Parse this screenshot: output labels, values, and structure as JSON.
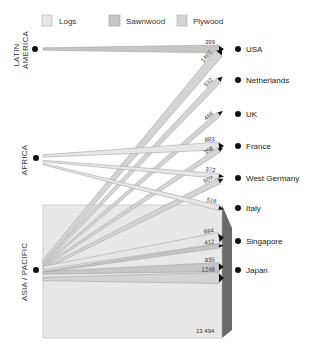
{
  "legend": [
    {
      "key": "logs",
      "label": "Logs",
      "color": "#e6e6e6"
    },
    {
      "key": "sawnwood",
      "label": "Sawnwood",
      "color": "#c6c6c6"
    },
    {
      "key": "plywood",
      "label": "Plywood",
      "color": "#d4d4d4"
    }
  ],
  "sources": [
    {
      "id": "latin_america",
      "lines": [
        "LATIN",
        "AMERICA"
      ]
    },
    {
      "id": "africa",
      "lines": [
        "AFRICA"
      ]
    },
    {
      "id": "asia_pacific",
      "lines": [
        "ASIA / PACIFIC"
      ]
    }
  ],
  "destinations": [
    {
      "id": "usa",
      "label": "USA"
    },
    {
      "id": "netherlands",
      "label": "Netherlands"
    },
    {
      "id": "uk",
      "label": "UK"
    },
    {
      "id": "france",
      "label": "France"
    },
    {
      "id": "west_germany",
      "label": "West Germany"
    },
    {
      "id": "italy",
      "label": "Italy"
    },
    {
      "id": "singapore",
      "label": "Singapore"
    },
    {
      "id": "japan",
      "label": "Japan"
    }
  ],
  "flows": [
    {
      "from": "latin_america",
      "to": "usa",
      "type": "sawnwood",
      "value": 399,
      "label": "399"
    },
    {
      "from": "asia_pacific",
      "to": "usa",
      "type": "plywood",
      "value": 1462,
      "label": "1462"
    },
    {
      "from": "asia_pacific",
      "to": "netherlands",
      "type": "plywood",
      "value": 532,
      "label": "532"
    },
    {
      "from": "asia_pacific",
      "to": "uk",
      "type": "plywood",
      "value": 466,
      "label": "466"
    },
    {
      "from": "africa",
      "to": "france",
      "type": "logs",
      "value": 883,
      "label": "883"
    },
    {
      "from": "asia_pacific",
      "to": "france",
      "type": "plywood",
      "value": 358,
      "label": "358"
    },
    {
      "from": "africa",
      "to": "west_germany",
      "type": "logs",
      "value": 372,
      "label": "372"
    },
    {
      "from": "asia_pacific",
      "to": "west_germany",
      "type": "plywood",
      "value": 507,
      "label": "507"
    },
    {
      "from": "africa",
      "to": "italy",
      "type": "logs",
      "value": 516,
      "label": "516"
    },
    {
      "from": "asia_pacific",
      "to": "singapore",
      "type": "logs",
      "value": 984,
      "label": "984"
    },
    {
      "from": "asia_pacific",
      "to": "singapore",
      "type": "sawnwood",
      "value": 412,
      "label": "412"
    },
    {
      "from": "asia_pacific",
      "to": "japan",
      "type": "sawnwood",
      "value": 935,
      "label": "935"
    },
    {
      "from": "asia_pacific",
      "to": "japan",
      "type": "plywood",
      "value": 1248,
      "label": "1248"
    },
    {
      "from": "asia_pacific",
      "to": "japan",
      "type": "logs",
      "value": 13494,
      "label": "13 494"
    }
  ]
}
